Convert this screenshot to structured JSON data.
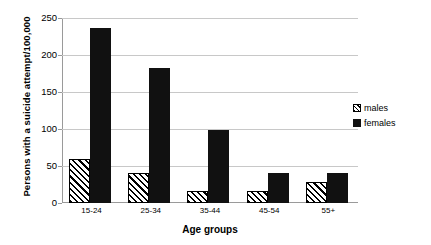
{
  "chart_data": {
    "type": "bar",
    "title": "",
    "xlabel": "Age groups",
    "ylabel": "Persons with a suicide attempt/100,000",
    "categories": [
      "15-24",
      "25-34",
      "35-44",
      "45-54",
      "55+"
    ],
    "series": [
      {
        "name": "males",
        "values": [
          60,
          41,
          16,
          16,
          28
        ],
        "pattern": "diagonal-hatch",
        "color": "#000000"
      },
      {
        "name": "females",
        "values": [
          237,
          182,
          99,
          40,
          40
        ],
        "pattern": "solid",
        "color": "#111111"
      }
    ],
    "ylim": [
      0,
      250
    ],
    "y_ticks": [
      0,
      50,
      100,
      150,
      200,
      250
    ],
    "grid": true,
    "legend_position": "right"
  },
  "axes": {
    "y_title": "Persons with a suicide attempt/100,000",
    "x_title": "Age groups",
    "y_tick_labels": [
      "250",
      "200",
      "150",
      "100",
      "50",
      "0"
    ],
    "x_tick_labels": [
      "15-24",
      "25-34",
      "35-44",
      "45-54",
      "55+"
    ]
  },
  "legend": {
    "items": [
      {
        "label": "males"
      },
      {
        "label": "females"
      }
    ]
  },
  "colors": {
    "grid": "#c8c8c8",
    "axis": "#9a9a9a",
    "females_bar": "#111111",
    "males_bar_outline": "#000000",
    "background": "#ffffff"
  }
}
